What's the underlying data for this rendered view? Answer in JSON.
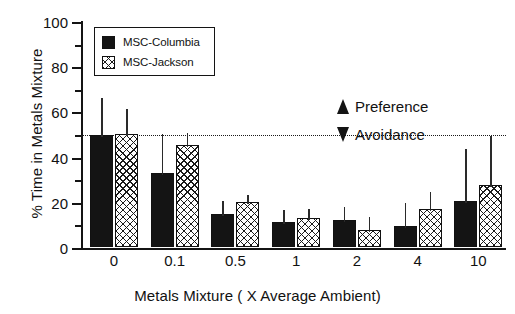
{
  "chart_data": {
    "type": "bar",
    "title": "",
    "xlabel": "Metals Mixture ( X Average Ambient)",
    "ylabel": "% Time in Metals Mixture",
    "categories": [
      "0",
      "0.1",
      "0.5",
      "1",
      "2",
      "4",
      "10"
    ],
    "ylim": [
      0,
      100
    ],
    "ytick_labels": [
      "0",
      "20",
      "40",
      "60",
      "80",
      "100"
    ],
    "ytick_values": [
      0,
      20,
      40,
      60,
      80,
      100
    ],
    "grid": false,
    "legend_position": "top-left",
    "series": [
      {
        "name": "MSC-Columbia",
        "fill": "solid-black",
        "values": [
          49.5,
          32.8,
          14.8,
          11.0,
          11.8,
          9.5,
          20.5
        ],
        "errors_upper": [
          66.0,
          50.0,
          20.5,
          16.5,
          17.5,
          19.5,
          43.5
        ]
      },
      {
        "name": "MSC-Jackson",
        "fill": "cross-hatch",
        "values": [
          50.0,
          45.0,
          20.0,
          13.0,
          7.5,
          17.0,
          27.5
        ],
        "errors_upper": [
          61.0,
          50.5,
          23.0,
          17.0,
          13.5,
          24.5,
          49.0
        ]
      }
    ],
    "reference_line": {
      "value": 50,
      "style": "dotted"
    },
    "annotations": [
      {
        "name": "preference",
        "text": "Preference",
        "arrow": "up",
        "above_reference_line": true
      },
      {
        "name": "avoidance",
        "text": "Avoidance",
        "arrow": "down",
        "above_reference_line": false
      }
    ],
    "colors": {
      "series_1": "#141414",
      "series_2": "#ffffff",
      "axis": "#141414",
      "hatch": "#1a1a1a"
    }
  },
  "legend": {
    "items": [
      {
        "label": "MSC-Columbia"
      },
      {
        "label": "MSC-Jackson"
      }
    ]
  },
  "axes": {
    "ylabel": "% Time in Metals Mixture",
    "xlabel": "Metals Mixture ( X Average Ambient)",
    "yticks": [
      "100",
      "80",
      "60",
      "40",
      "20",
      "0"
    ],
    "xticks": [
      "0",
      "0.1",
      "0.5",
      "1",
      "2",
      "4",
      "10"
    ]
  },
  "annotations": {
    "preference": "Preference",
    "avoidance": "Avoidance"
  }
}
